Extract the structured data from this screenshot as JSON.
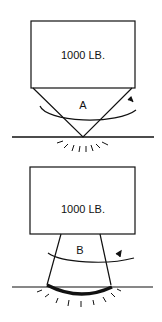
{
  "figure_a": {
    "weight_label": "1000 LB.",
    "label": "A"
  },
  "figure_b": {
    "weight_label": "1000 LB.",
    "label": "B"
  },
  "colors": {
    "stroke": "#111111",
    "background": "#ffffff"
  }
}
